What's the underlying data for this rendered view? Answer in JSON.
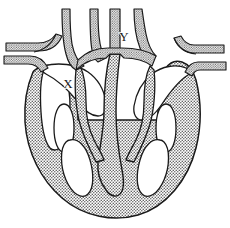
{
  "figure": {
    "kind": "anatomical-line-drawing",
    "background_color": "#ffffff",
    "outline_color": "#1a1a1a",
    "muscle_fill_color": "#a8a8a8",
    "muscle_fill_style": "stipple-halftone-dots",
    "chamber_fill_color": "#ffffff",
    "vessel_fill_style": "stipple-halftone-dots",
    "width": 230,
    "height": 228
  },
  "labels": [
    {
      "id": "label-x",
      "text": "X",
      "x": 68,
      "y": 88,
      "describes": "left-side chamber"
    },
    {
      "id": "label-y",
      "text": "Y",
      "x": 124,
      "y": 41,
      "describes": "upper central great vessel"
    }
  ],
  "structures": {
    "great_vessels_top": [
      {
        "name": "vessel-trunk-1",
        "position": "upper-left"
      },
      {
        "name": "vessel-trunk-2",
        "position": "upper-left-inner"
      },
      {
        "name": "vessel-trunk-3",
        "position": "upper-center"
      },
      {
        "name": "vessel-trunk-4",
        "position": "upper-center-right"
      }
    ],
    "lateral_vessels_left": [
      {
        "name": "lateral-vessel-left-upper"
      },
      {
        "name": "lateral-vessel-left-lower"
      }
    ],
    "lateral_vessels_right": [
      {
        "name": "lateral-vessel-right-upper"
      },
      {
        "name": "lateral-vessel-right-lower"
      }
    ],
    "chambers": [
      {
        "name": "chamber-upper-left",
        "fill": "white"
      },
      {
        "name": "chamber-upper-right",
        "fill": "white"
      },
      {
        "name": "chamber-lower-left",
        "fill": "white"
      },
      {
        "name": "chamber-lower-right",
        "fill": "white"
      },
      {
        "name": "chamber-left-slit",
        "fill": "white"
      },
      {
        "name": "chamber-right-slit",
        "fill": "white"
      }
    ],
    "septum": {
      "name": "interventricular-septum"
    },
    "valves": [
      {
        "name": "valve-leaflet-left"
      },
      {
        "name": "valve-leaflet-right"
      }
    ],
    "apex": {
      "name": "heart-apex",
      "position": "bottom-center"
    }
  }
}
